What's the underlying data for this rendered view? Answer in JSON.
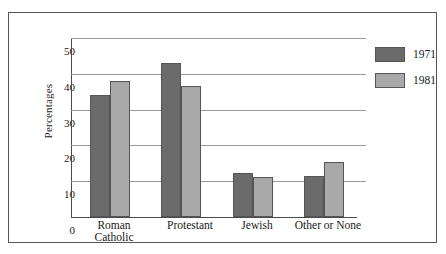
{
  "chart_data": {
    "type": "bar",
    "title": "",
    "subtitle": "",
    "xlabel": "",
    "ylabel": "Percentages",
    "categories": [
      "Roman\nCatholic",
      "Protestant",
      "Jewish",
      "Other or None"
    ],
    "category_labels_flat": [
      "Roman Catholic",
      "Protestant",
      "Jewish",
      "Other or None"
    ],
    "series": [
      {
        "name": "1971",
        "color": "#6b6b6b",
        "values": [
          34,
          43,
          12.2,
          11.5
        ]
      },
      {
        "name": "1981",
        "color": "#a9a9a9",
        "values": [
          38,
          36.5,
          11.3,
          15.5
        ]
      }
    ],
    "ylim": [
      0,
      50
    ],
    "yticks": [
      0,
      10,
      20,
      30,
      40,
      50
    ],
    "ytick_labels": [
      "0",
      "10",
      "20",
      "30",
      "40",
      "50"
    ],
    "grid": true,
    "grid_axis": "y",
    "legend_position": "top-right",
    "legend_entries": [
      "1971",
      "1981"
    ]
  },
  "axes": {
    "y_title": "Percentages",
    "tick_0": "0",
    "tick_10": "10",
    "tick_20": "20",
    "tick_30": "30",
    "tick_40": "40",
    "tick_50": "50"
  },
  "legend": {
    "items": [
      {
        "label": "1971"
      },
      {
        "label": "1981"
      }
    ]
  },
  "categories": [
    {
      "label": "Roman\nCatholic"
    },
    {
      "label": "Protestant"
    },
    {
      "label": "Jewish"
    },
    {
      "label": "Other or None"
    }
  ]
}
